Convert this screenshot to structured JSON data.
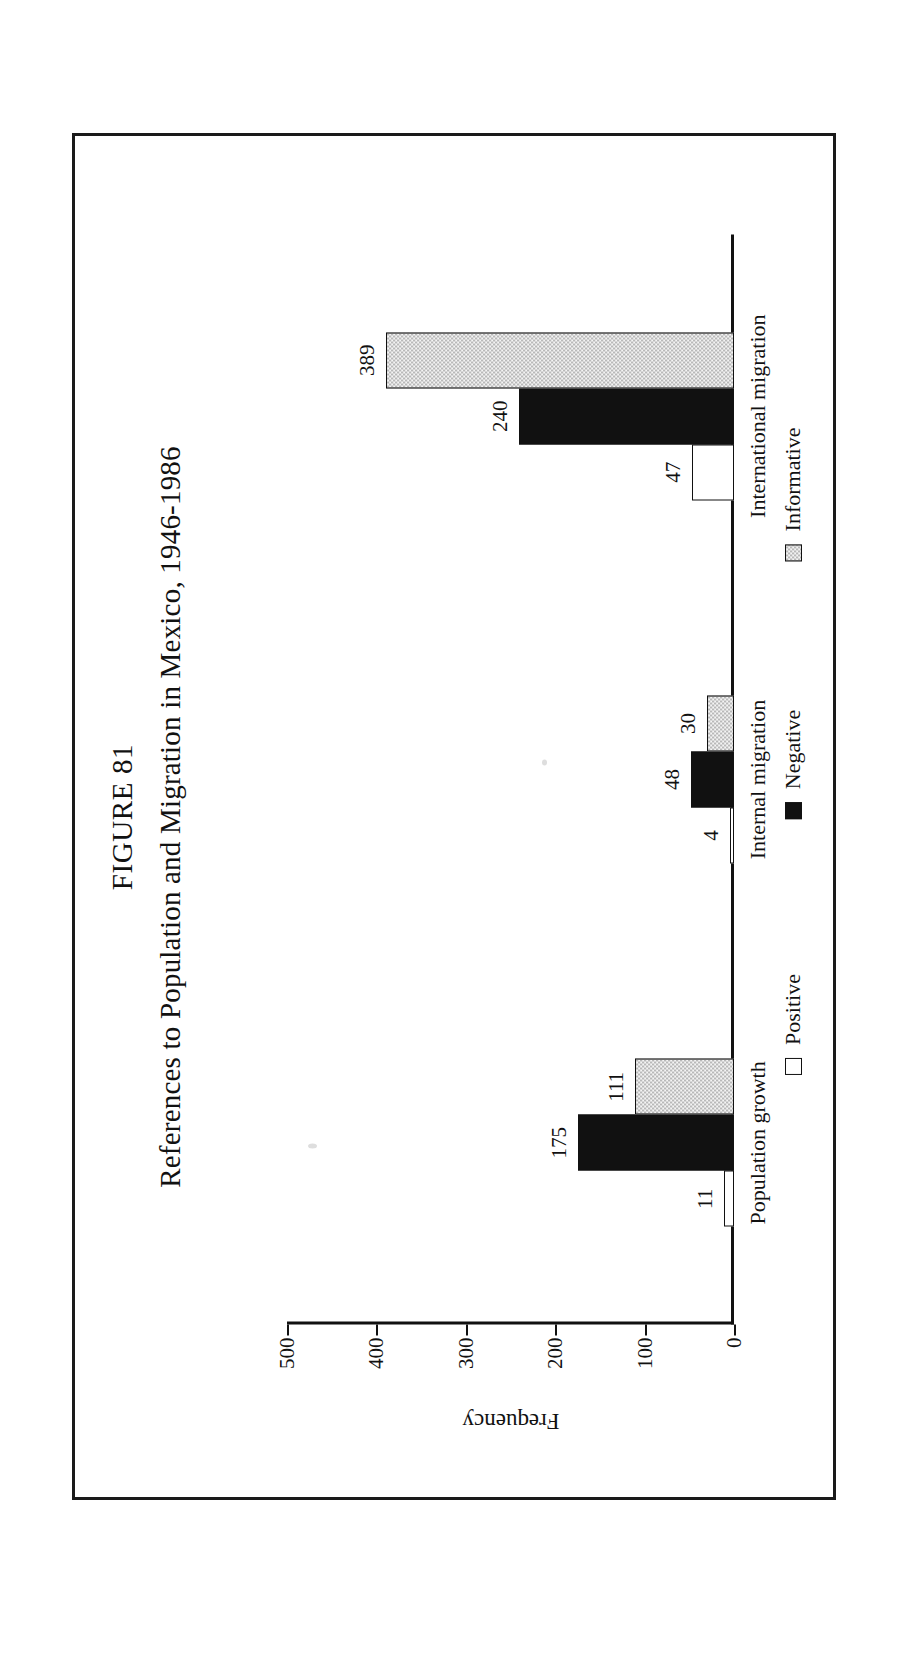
{
  "figure": {
    "number": "FIGURE 81",
    "title": "References to Population and Migration in Mexico, 1946-1986"
  },
  "chart_data": {
    "type": "bar",
    "title": "References to Population and Migration in Mexico, 1946-1986",
    "xlabel": "",
    "ylabel": "Frequency",
    "ylim": [
      0,
      500
    ],
    "yticks": [
      "0",
      "100",
      "200",
      "300",
      "400",
      "500"
    ],
    "grid": false,
    "orientation": "vertical",
    "legend_position": "bottom",
    "categories": [
      "Population growth",
      "Internal migration",
      "International migration"
    ],
    "series": [
      {
        "name": "Positive",
        "values": [
          11,
          4,
          47
        ],
        "swatch": "white-outline"
      },
      {
        "name": "Negative",
        "values": [
          175,
          48,
          240
        ],
        "swatch": "solid-black"
      },
      {
        "name": "Informative",
        "values": [
          111,
          30,
          389
        ],
        "swatch": "gray-dotted"
      }
    ],
    "data_labels": {
      "Population growth": {
        "Positive": "11",
        "Negative": "175",
        "Informative": "111"
      },
      "Internal migration": {
        "Positive": "4",
        "Negative": "48",
        "Informative": "30"
      },
      "International migration": {
        "Positive": "47",
        "Negative": "240",
        "Informative": "389"
      }
    }
  },
  "colors": {
    "ink": "#111111",
    "positive": "#ffffff",
    "negative": "#111111",
    "informative": "#b9b9b9",
    "page": "#ffffff"
  }
}
